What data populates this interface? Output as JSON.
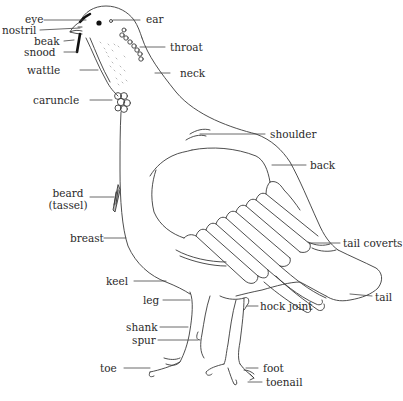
{
  "diagram": {
    "line_color": "#3a3a3a",
    "background": "#ffffff",
    "labels": {
      "eye": "eye",
      "ear": "ear",
      "nostril": "nostril",
      "beak": "beak",
      "snood": "snood",
      "throat": "throat",
      "wattle": "wattle",
      "neck": "neck",
      "caruncle": "caruncle",
      "shoulder": "shoulder",
      "back": "back",
      "beard_line1": "beard",
      "beard_line2": "(tassel)",
      "breast": "breast",
      "tail_coverts": "tail coverts",
      "keel": "keel",
      "tail": "tail",
      "leg": "leg",
      "hock_joint": "hock joint",
      "shank": "shank",
      "spur": "spur",
      "toe": "toe",
      "foot": "foot",
      "toenail": "toenail"
    }
  }
}
